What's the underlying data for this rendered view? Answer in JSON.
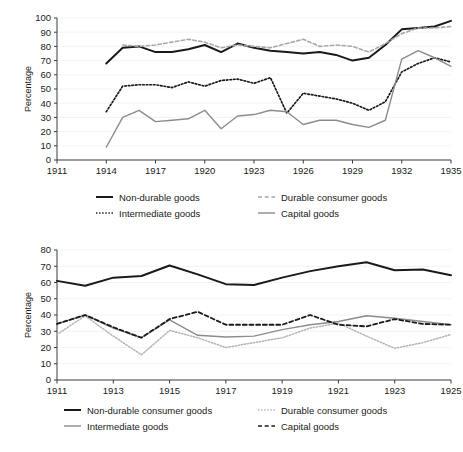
{
  "figure": {
    "background": "#ffffff",
    "panels": [
      "top",
      "bottom"
    ]
  },
  "chart_data": [
    {
      "id": "top",
      "type": "line",
      "title": "",
      "xlabel": "",
      "ylabel": "Percentage",
      "xlim": [
        1911,
        1935
      ],
      "ylim": [
        0,
        100
      ],
      "ytick_step": 10,
      "yticks": [
        0,
        10,
        20,
        30,
        40,
        50,
        60,
        70,
        80,
        90,
        100
      ],
      "xticks": [
        1911,
        1914,
        1917,
        1920,
        1923,
        1926,
        1929,
        1932,
        1935
      ],
      "grid": true,
      "legend_position": "below",
      "x": [
        1914,
        1915,
        1916,
        1917,
        1918,
        1919,
        1920,
        1921,
        1922,
        1923,
        1924,
        1925,
        1926,
        1927,
        1928,
        1929,
        1930,
        1931,
        1932,
        1933,
        1934,
        1935
      ],
      "series": [
        {
          "name": "Non-durable goods",
          "style": "solid",
          "color": "#1a1a1a",
          "width": 2.0,
          "values": [
            68,
            79,
            80,
            76,
            76,
            78,
            81,
            76,
            82,
            79,
            77,
            76,
            75,
            76,
            74,
            70,
            72,
            81,
            92,
            93,
            94,
            98
          ]
        },
        {
          "name": "Durable consumer goods",
          "style": "dashed",
          "color": "#a8a8a8",
          "width": 1.6,
          "values": [
            null,
            81,
            80,
            81,
            83,
            85,
            83,
            79,
            81,
            80,
            79,
            82,
            85,
            80,
            81,
            80,
            76,
            82,
            89,
            93,
            93,
            94
          ]
        },
        {
          "name": "Intermediate goods",
          "style": "dotted",
          "color": "#1a1a1a",
          "width": 1.7,
          "values": [
            34,
            52,
            53,
            53,
            51,
            55,
            52,
            56,
            57,
            54,
            58,
            33,
            47,
            45,
            43,
            40,
            35,
            41,
            62,
            68,
            72,
            69
          ]
        },
        {
          "name": "Capital goods",
          "style": "solid",
          "color": "#8c8c8c",
          "width": 1.4,
          "values": [
            9,
            30,
            35,
            27,
            28,
            29,
            35,
            22,
            31,
            32,
            35,
            34,
            25,
            28,
            28,
            25,
            23,
            28,
            71,
            77,
            72,
            66
          ]
        }
      ]
    },
    {
      "id": "bottom",
      "type": "line",
      "title": "",
      "xlabel": "",
      "ylabel": "Percentage",
      "xlim": [
        1911,
        1925
      ],
      "ylim": [
        0,
        80
      ],
      "ytick_step": 10,
      "yticks": [
        0,
        10,
        20,
        30,
        40,
        50,
        60,
        70,
        80
      ],
      "xticks": [
        1911,
        1913,
        1915,
        1917,
        1919,
        1921,
        1923,
        1925
      ],
      "grid": true,
      "legend_position": "below",
      "x": [
        1911,
        1912,
        1913,
        1914,
        1915,
        1916,
        1917,
        1918,
        1919,
        1920,
        1921,
        1922,
        1923,
        1924,
        1925
      ],
      "series": [
        {
          "name": "Non-durable consumer goods",
          "style": "solid",
          "color": "#1a1a1a",
          "width": 2.0,
          "values": [
            61,
            58,
            63,
            64,
            70.5,
            65,
            59,
            58.5,
            63,
            67,
            70,
            72.5,
            67.5,
            68,
            64.5
          ]
        },
        {
          "name": "Durable consumer goods",
          "style": "dotted",
          "color": "#b4b4b4",
          "width": 1.5,
          "values": [
            28,
            39.5,
            27,
            15.5,
            30.5,
            26,
            20,
            23,
            26,
            32,
            35,
            27,
            19.5,
            23,
            28
          ]
        },
        {
          "name": "Intermediate goods",
          "style": "solid",
          "color": "#8c8c8c",
          "width": 1.4,
          "values": [
            34.5,
            40,
            32,
            26,
            37,
            27.5,
            26.5,
            27,
            31,
            34,
            36,
            39.5,
            38,
            36,
            34
          ]
        },
        {
          "name": "Capital goods",
          "style": "dashed",
          "color": "#1a1a1a",
          "width": 1.8,
          "values": [
            34.5,
            40,
            32.5,
            26,
            37.5,
            42,
            34,
            34,
            34,
            40,
            34,
            33,
            37.5,
            34.5,
            34
          ]
        }
      ]
    }
  ],
  "top_chart": {
    "ylabel": "Percentage",
    "ytick_labels": [
      "0",
      "10",
      "20",
      "30",
      "40",
      "50",
      "60",
      "70",
      "80",
      "90",
      "100"
    ],
    "xtick_labels": [
      "1911",
      "1914",
      "1917",
      "1920",
      "1923",
      "1926",
      "1929",
      "1932",
      "1935"
    ],
    "legend": [
      {
        "label": "Non-durable goods",
        "style": "solid",
        "color": "#1a1a1a"
      },
      {
        "label": "Durable consumer goods",
        "style": "dashed",
        "color": "#a8a8a8"
      },
      {
        "label": "Intermediate goods",
        "style": "dotted",
        "color": "#1a1a1a"
      },
      {
        "label": "Capital goods",
        "style": "solid",
        "color": "#8c8c8c"
      }
    ]
  },
  "bottom_chart": {
    "ylabel": "Percentage",
    "ytick_labels": [
      "0",
      "10",
      "20",
      "30",
      "40",
      "50",
      "60",
      "70",
      "80"
    ],
    "xtick_labels": [
      "1911",
      "1913",
      "1915",
      "1917",
      "1919",
      "1921",
      "1923",
      "1925"
    ],
    "legend": [
      {
        "label": "Non-durable consumer goods",
        "style": "solid",
        "color": "#1a1a1a"
      },
      {
        "label": "Durable consumer goods",
        "style": "dotted",
        "color": "#b4b4b4"
      },
      {
        "label": "Intermediate goods",
        "style": "solid",
        "color": "#8c8c8c"
      },
      {
        "label": "Capital goods",
        "style": "dashed",
        "color": "#1a1a1a"
      }
    ]
  }
}
